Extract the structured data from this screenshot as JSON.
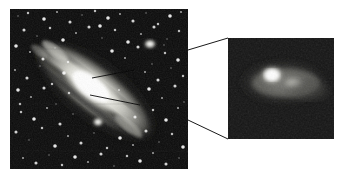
{
  "figure": {
    "title": "Andromeda Galaxy (M31) wide field with magnified double nucleus",
    "background_color": "#ffffff",
    "width": 342,
    "height": 175,
    "panel_count": 2
  },
  "main_panel": {
    "name": "wide-field-image",
    "caption": "",
    "frame": {
      "x": 10,
      "y": 9,
      "width": 178,
      "height": 160
    },
    "border_color": "#000000",
    "sky_color": "#0a0a0a",
    "galaxy": {
      "name": "M31",
      "type": "spiral",
      "inclination_description": "highly inclined, major axis upper-left to lower-right",
      "position_angle_deg": 38,
      "core_color": "#f2f2ee",
      "disk_color": "#cfcfc8",
      "dust_lane_color": "#3a3a38"
    },
    "companions": [
      {
        "label": "M32",
        "x": 150,
        "y": 44,
        "radius": 6,
        "brightness": "#ffffff"
      },
      {
        "label": "bright-knot",
        "x": 98,
        "y": 122,
        "radius": 5,
        "brightness": "#f6f6f2"
      }
    ],
    "pointer_lines": [
      {
        "name": "nucleus-pointer-upper",
        "x1": 92,
        "y1": 78,
        "x2": 130,
        "y2": 70
      },
      {
        "name": "nucleus-pointer-lower",
        "x1": 92,
        "y1": 95,
        "x2": 138,
        "y2": 103
      }
    ]
  },
  "inset_panel": {
    "name": "nucleus-closeup",
    "caption": "",
    "frame": {
      "x": 228,
      "y": 38,
      "width": 106,
      "height": 101
    },
    "border_color": "#000000",
    "sky_color": "#141414",
    "nuclei": [
      {
        "label": "P1",
        "x": 272,
        "y": 75,
        "rx": 13,
        "ry": 10,
        "peak_color": "#ffffff"
      },
      {
        "label": "P2",
        "x": 293,
        "y": 83,
        "rx": 11,
        "ry": 7,
        "peak_color": "#b9b9b4"
      }
    ],
    "halo_color": "#6e6e6a"
  },
  "connectors": [
    {
      "name": "connector-top",
      "x1": 188,
      "y1": 50,
      "x2": 228,
      "y2": 38
    },
    {
      "name": "connector-bottom",
      "x1": 188,
      "y1": 120,
      "x2": 228,
      "y2": 139
    }
  ],
  "colors": {
    "background": "#ffffff",
    "frame": "#000000",
    "connector": "#1a1a1a",
    "star": "#ffffff"
  },
  "chart_data": {
    "type": "heatmap",
    "title": "Andromeda Galaxy (M31) wide field with magnified double nucleus",
    "xlabel": "",
    "ylabel": "",
    "panels": [
      {
        "name": "wide-field",
        "description": "Inclined spiral galaxy disk with dust lanes and surrounding star field",
        "bounds": [
          10,
          9,
          188,
          169
        ]
      },
      {
        "name": "nucleus-closeup",
        "description": "Magnified core showing two brightness peaks P1 and P2",
        "bounds": [
          228,
          38,
          334,
          139
        ]
      }
    ],
    "stars": [
      [
        18,
        16
      ],
      [
        28,
        13
      ],
      [
        44,
        19
      ],
      [
        57,
        12
      ],
      [
        70,
        22
      ],
      [
        82,
        15
      ],
      [
        95,
        11
      ],
      [
        108,
        18
      ],
      [
        120,
        14
      ],
      [
        133,
        21
      ],
      [
        146,
        13
      ],
      [
        158,
        24
      ],
      [
        170,
        16
      ],
      [
        181,
        12
      ],
      [
        24,
        30
      ],
      [
        37,
        36
      ],
      [
        50,
        28
      ],
      [
        63,
        40
      ],
      [
        76,
        33
      ],
      [
        89,
        27
      ],
      [
        102,
        38
      ],
      [
        115,
        30
      ],
      [
        128,
        42
      ],
      [
        141,
        34
      ],
      [
        154,
        27
      ],
      [
        167,
        39
      ],
      [
        179,
        31
      ],
      [
        16,
        46
      ],
      [
        30,
        52
      ],
      [
        43,
        59
      ],
      [
        55,
        48
      ],
      [
        68,
        62
      ],
      [
        112,
        51
      ],
      [
        125,
        58
      ],
      [
        138,
        47
      ],
      [
        152,
        64
      ],
      [
        165,
        53
      ],
      [
        178,
        60
      ],
      [
        15,
        70
      ],
      [
        27,
        78
      ],
      [
        40,
        66
      ],
      [
        52,
        84
      ],
      [
        64,
        73
      ],
      [
        145,
        72
      ],
      [
        158,
        80
      ],
      [
        171,
        68
      ],
      [
        183,
        76
      ],
      [
        18,
        90
      ],
      [
        31,
        97
      ],
      [
        44,
        88
      ],
      [
        56,
        104
      ],
      [
        69,
        93
      ],
      [
        149,
        89
      ],
      [
        162,
        98
      ],
      [
        175,
        86
      ],
      [
        184,
        102
      ],
      [
        21,
        112
      ],
      [
        34,
        119
      ],
      [
        47,
        108
      ],
      [
        60,
        124
      ],
      [
        73,
        114
      ],
      [
        153,
        110
      ],
      [
        166,
        120
      ],
      [
        178,
        108
      ],
      [
        16,
        132
      ],
      [
        29,
        140
      ],
      [
        42,
        128
      ],
      [
        55,
        146
      ],
      [
        68,
        136
      ],
      [
        81,
        143
      ],
      [
        94,
        133
      ],
      [
        107,
        148
      ],
      [
        120,
        138
      ],
      [
        133,
        145
      ],
      [
        146,
        131
      ],
      [
        159,
        142
      ],
      [
        172,
        134
      ],
      [
        183,
        147
      ],
      [
        23,
        158
      ],
      [
        36,
        163
      ],
      [
        49,
        155
      ],
      [
        62,
        165
      ],
      [
        75,
        157
      ],
      [
        88,
        162
      ],
      [
        101,
        154
      ],
      [
        114,
        166
      ],
      [
        127,
        156
      ],
      [
        140,
        161
      ],
      [
        153,
        153
      ],
      [
        166,
        164
      ],
      [
        179,
        158
      ],
      [
        20,
        104
      ],
      [
        100,
        26
      ],
      [
        119,
        90
      ],
      [
        135,
        117
      ],
      [
        164,
        45
      ]
    ],
    "nuclei_peaks": [
      {
        "label": "P1",
        "relative_brightness": 1.0
      },
      {
        "label": "P2",
        "relative_brightness": 0.55
      }
    ]
  }
}
